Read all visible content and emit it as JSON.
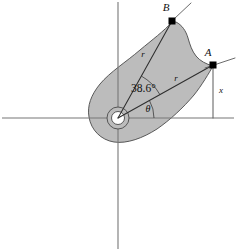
{
  "figure": {
    "canvas": {
      "width": 236,
      "height": 251
    },
    "colors": {
      "background": "#ffffff",
      "body_fill": "#bcbcbc",
      "body_stroke": "#4a4a4a",
      "axis": "#777777",
      "line": "#3a3a3a",
      "text": "#111111",
      "marker": "#000000"
    },
    "axes": {
      "name": "reference-axes",
      "origin": {
        "x": 118,
        "y": 118
      },
      "horizontal": {
        "x1": 2,
        "y1": 118,
        "x2": 234,
        "y2": 118
      },
      "vertical": {
        "x1": 118,
        "y1": 2,
        "x2": 118,
        "y2": 249
      }
    },
    "pivot": {
      "name": "pivot-hub",
      "cx": 118,
      "cy": 118,
      "outer_r": 11,
      "inner_r": 6.5
    },
    "points": [
      {
        "id": "B",
        "label": "B",
        "x": 172,
        "y": 21,
        "label_x": 166,
        "label_y": 11
      },
      {
        "id": "A",
        "label": "A",
        "x": 213,
        "y": 65,
        "label_x": 208,
        "label_y": 56
      }
    ],
    "labels": {
      "angle_value": "38.6°",
      "angle_x": 131,
      "angle_y": 92,
      "theta": "θ",
      "theta_x": 148,
      "theta_y": 112,
      "radius_upper": "r",
      "radius_upper_x": 143,
      "radius_upper_y": 57,
      "radius_lower": "r",
      "radius_lower_x": 176,
      "radius_lower_y": 81,
      "x_offset": "x",
      "x_offset_x": 221,
      "x_offset_y": 93
    },
    "segments": [
      {
        "name": "radius-to-B",
        "x1": 118,
        "y1": 118,
        "x2": 172,
        "y2": 21
      },
      {
        "name": "radius-to-A",
        "x1": 118,
        "y1": 118,
        "x2": 213,
        "y2": 65
      },
      {
        "name": "x-offset-line",
        "x1": 213,
        "y1": 65,
        "x2": 213,
        "y2": 118
      },
      {
        "name": "tangent-at-B",
        "x1": 172,
        "y1": 21,
        "x2": 190,
        "y2": 4
      },
      {
        "name": "tangent-at-A",
        "x1": 213,
        "y1": 65,
        "x2": 235,
        "y2": 58
      }
    ],
    "arcs": [
      {
        "name": "angle-arc-38-6",
        "radius": 48,
        "from_deg": -29.1,
        "to_deg": -60.9
      },
      {
        "name": "angle-arc-theta",
        "radius": 36,
        "from_deg": 0,
        "to_deg": -29.1
      }
    ],
    "body_outline": {
      "name": "cam-body-outline",
      "path": "M 172 21 C 166 29, 158 34, 150 41 C 138 51, 124 60, 112 72 C 100 83, 91 94, 90 106 C 89 120, 96 133, 110 138 C 124 143, 142 138, 158 128 C 172 119, 190 98, 202 82 C 208 74, 212 69, 213 65 C 208 62, 203 60, 199 57 C 195 54, 192 50, 190 45 C 188 40, 187 34, 185 29 C 183 25, 178 22, 172 21 Z"
    }
  }
}
